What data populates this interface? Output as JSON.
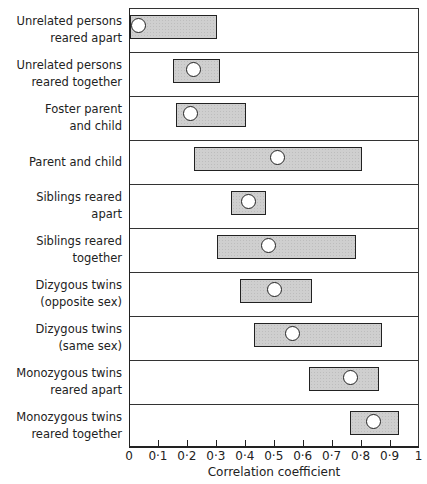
{
  "chart_data": {
    "type": "range-bar",
    "title": "",
    "xlabel": "Correlation coefficient",
    "ylabel": "",
    "xlim": [
      0,
      1
    ],
    "grid": false,
    "x_ticks": [
      "0",
      "0·1",
      "0·2",
      "0·3",
      "0·4",
      "0·5",
      "0·6",
      "0·7",
      "0·8",
      "0·9",
      "1"
    ],
    "categories": [
      "Unrelated persons\nreared apart",
      "Unrelated persons\nreared together",
      "Foster parent\nand child",
      "Parent and child",
      "Siblings reared\napart",
      "Siblings reared\ntogether",
      "Dizygous twins\n(opposite sex)",
      "Dizygous twins\n(same sex)",
      "Monozygous twins\nreared apart",
      "Monozygous twins\nreared together"
    ],
    "series": [
      {
        "name": "range_low",
        "values": [
          0.0,
          0.15,
          0.16,
          0.22,
          0.35,
          0.3,
          0.38,
          0.43,
          0.62,
          0.76
        ]
      },
      {
        "name": "range_high",
        "values": [
          0.3,
          0.31,
          0.4,
          0.8,
          0.47,
          0.78,
          0.63,
          0.87,
          0.86,
          0.93
        ]
      },
      {
        "name": "median",
        "values": [
          0.03,
          0.22,
          0.21,
          0.51,
          0.41,
          0.48,
          0.5,
          0.56,
          0.76,
          0.84
        ]
      }
    ]
  }
}
